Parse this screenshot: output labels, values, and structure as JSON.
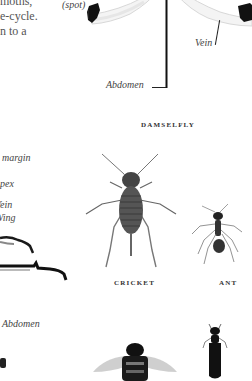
{
  "intro_text": {
    "lines": [
      "moths,",
      "e-cycle.",
      "n to a"
    ]
  },
  "damselfly": {
    "caption": "DAMSELFLY",
    "labels": {
      "spot": "(spot)",
      "vein": "Vein",
      "abdomen": "Abdomen"
    }
  },
  "left_specimen": {
    "labels": {
      "margin": "margin",
      "apex": "Apex",
      "vein": "Vein",
      "wing": "Wing",
      "abdomen": "Abdomen"
    }
  },
  "cricket": {
    "caption": "CRICKET"
  },
  "ant": {
    "caption": "ANT"
  },
  "colors": {
    "background": "#ffffff",
    "ink": "#111111",
    "text": "#555555"
  }
}
